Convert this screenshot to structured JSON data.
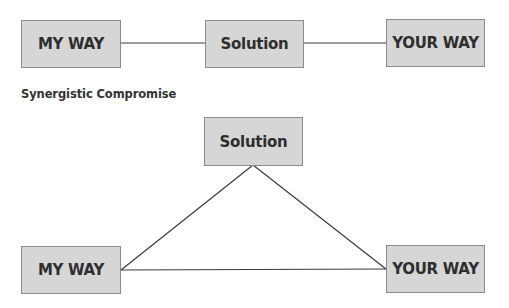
{
  "top_diagram": {
    "left_box": "MY WAY",
    "center_box": "Solution",
    "right_box": "YOUR WAY"
  },
  "caption": "Synergistic Compromise",
  "bottom_diagram": {
    "top_box": "Solution",
    "left_box": "MY WAY",
    "right_box": "YOUR WAY"
  },
  "colors": {
    "box_fill": "#d6d6d6",
    "box_border": "#8c8c8c",
    "line": "#3a3a3a",
    "text": "#2e2e2e"
  }
}
